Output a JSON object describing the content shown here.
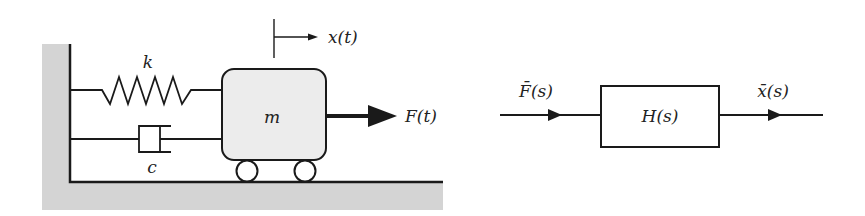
{
  "mechanical_system": {
    "spring_label": "k",
    "damper_label": "c",
    "mass_label": "m",
    "displacement_label": "x(t)",
    "force_label": "F(t)"
  },
  "block_diagram": {
    "input_label": "F̄(s)",
    "transfer_function_label": "H(s)",
    "output_label": "x̄(s)"
  },
  "colors": {
    "ground_fill": "#d4d4d4",
    "mass_fill": "#ececec",
    "stroke": "#1a1a1a"
  }
}
